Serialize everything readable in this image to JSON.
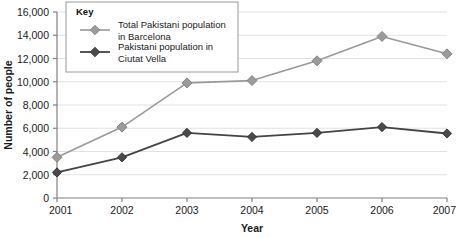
{
  "chart_data": {
    "type": "line",
    "title": "",
    "xlabel": "Year",
    "ylabel": "Number of people",
    "categories": [
      "2001",
      "2002",
      "2003",
      "2004",
      "2005",
      "2006",
      "2007"
    ],
    "x": [
      2001,
      2002,
      2003,
      2004,
      2005,
      2006,
      2007
    ],
    "xlim": [
      2001,
      2007
    ],
    "ylim": [
      0,
      16000
    ],
    "y_tick_step": 2000,
    "y_ticks": [
      "0",
      "2,000",
      "4,000",
      "6,000",
      "8,000",
      "10,000",
      "12,000",
      "14,000",
      "16,000"
    ],
    "y_tick_values": [
      0,
      2000,
      4000,
      6000,
      8000,
      10000,
      12000,
      14000,
      16000
    ],
    "grid": "horizontal",
    "legend_position": "top-left-inside",
    "legend_title": "Key",
    "series": [
      {
        "name": "Total Pakistani population in Barcelona",
        "name_line1": "Total Pakistani population",
        "name_line2": "in Barcelona",
        "color": "#999999",
        "marker": "diamond",
        "values": [
          3500,
          6100,
          9900,
          10100,
          11800,
          13900,
          12400
        ]
      },
      {
        "name": "Pakistani population in Ciutat Vella",
        "name_line1": "Pakistani population in",
        "name_line2": "Ciutat Vella",
        "color": "#444444",
        "marker": "diamond",
        "values": [
          2200,
          3500,
          5600,
          5250,
          5600,
          6100,
          5550
        ]
      }
    ]
  },
  "style": {
    "background": "#ffffff",
    "grid_color": "#e2e2e2",
    "axis_color": "#808080",
    "text_color": "#1a1a1a",
    "legend_border": "#9a9a9a",
    "legend_background": "#ffffff"
  }
}
